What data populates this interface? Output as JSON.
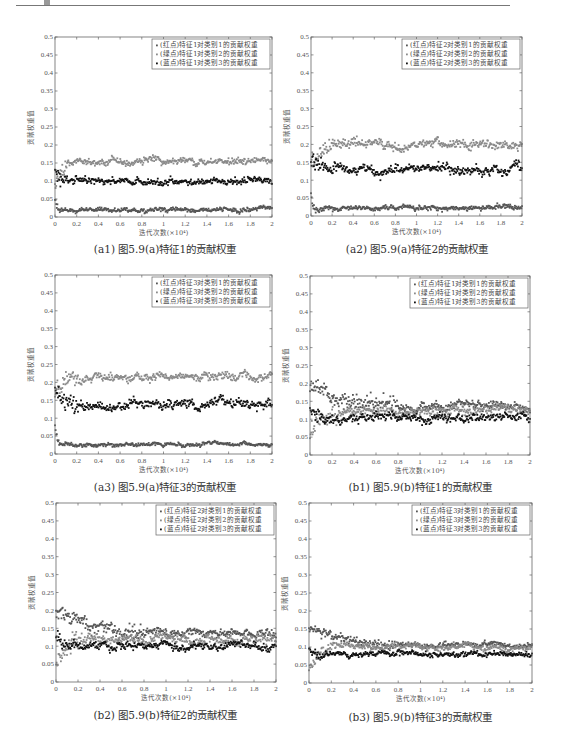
{
  "header": {
    "text": "……"
  },
  "colors": {
    "axis": "#666666",
    "series_red": "#555555",
    "series_green": "#8a8a8a",
    "series_blue": "#111111"
  },
  "chart_data": [
    {
      "id": "a1",
      "type": "scatter",
      "title": "",
      "caption": "(a1) 图5.9(a)特征1的贡献权重",
      "xlabel": "迭代次数(×10⁴)",
      "ylabel": "贡献权重值",
      "xlim": [
        0,
        2
      ],
      "ylim": [
        0,
        0.5
      ],
      "xticks": [
        "0",
        "0.2",
        "0.4",
        "0.6",
        "0.8",
        "1",
        "1.2",
        "1.4",
        "1.6",
        "1.8",
        "2"
      ],
      "yticks": [
        "0",
        "0.05",
        "0.1",
        "0.15",
        "0.2",
        "0.25",
        "0.3",
        "0.35",
        "0.4",
        "0.45",
        "0.5"
      ],
      "grid": false,
      "legend_position": "upper right",
      "series": [
        {
          "name": "(红点)特征1对类别1的贡献权重",
          "color_key": "series_red",
          "start": 0.05,
          "settle_x": 0.05,
          "mean": 0.02,
          "noise": 0.006
        },
        {
          "name": "(绿点)特征1对类别2的贡献权重",
          "color_key": "series_green",
          "start": 0.09,
          "settle_x": 0.15,
          "mean": 0.155,
          "noise": 0.01
        },
        {
          "name": "(蓝点)特征1对类别3的贡献权重",
          "color_key": "series_blue",
          "start": 0.13,
          "settle_x": 0.12,
          "mean": 0.1,
          "noise": 0.01
        }
      ]
    },
    {
      "id": "a2",
      "type": "scatter",
      "caption": "(a2) 图5.9(a)特征2的贡献权重",
      "xlabel": "迭代次数(×10⁴)",
      "ylabel": "贡献权重值",
      "xlim": [
        0,
        2
      ],
      "ylim": [
        0,
        0.5
      ],
      "xticks": [
        "0",
        "0.2",
        "0.4",
        "0.6",
        "0.8",
        "1",
        "1.2",
        "1.4",
        "1.6",
        "1.8",
        "2"
      ],
      "yticks": [
        "0",
        "0.05",
        "0.1",
        "0.15",
        "0.2",
        "0.25",
        "0.3",
        "0.35",
        "0.4",
        "0.45",
        "0.5"
      ],
      "grid": false,
      "legend_position": "upper right",
      "series": [
        {
          "name": "(红点)特征2对类别1的贡献权重",
          "color_key": "series_red",
          "start": 0.06,
          "settle_x": 0.05,
          "mean": 0.022,
          "noise": 0.007
        },
        {
          "name": "(绿点)特征2对类别2的贡献权重",
          "color_key": "series_green",
          "start": 0.15,
          "settle_x": 0.2,
          "mean": 0.2,
          "noise": 0.013
        },
        {
          "name": "(蓝点)特征2对类别3的贡献权重",
          "color_key": "series_blue",
          "start": 0.16,
          "settle_x": 0.15,
          "mean": 0.13,
          "noise": 0.013
        }
      ]
    },
    {
      "id": "a3",
      "type": "scatter",
      "caption": "(a3) 图5.9(a)特征3的贡献权重",
      "xlabel": "迭代次数(×10⁴)",
      "ylabel": "贡献权重值",
      "xlim": [
        0,
        2
      ],
      "ylim": [
        0,
        0.5
      ],
      "xticks": [
        "0",
        "0.2",
        "0.4",
        "0.6",
        "0.8",
        "1",
        "1.2",
        "1.4",
        "1.6",
        "1.8",
        "2"
      ],
      "yticks": [
        "0",
        "0.05",
        "0.1",
        "0.15",
        "0.2",
        "0.25",
        "0.3",
        "0.35",
        "0.4",
        "0.45",
        "0.5"
      ],
      "grid": false,
      "legend_position": "upper right",
      "series": [
        {
          "name": "(红点)特征3对类别1的贡献权重",
          "color_key": "series_red",
          "start": 0.08,
          "settle_x": 0.05,
          "mean": 0.027,
          "noise": 0.005
        },
        {
          "name": "(绿点)特征3对类别2的贡献权重",
          "color_key": "series_green",
          "start": 0.17,
          "settle_x": 0.2,
          "mean": 0.215,
          "noise": 0.013
        },
        {
          "name": "(蓝点)特征3对类别3的贡献权重",
          "color_key": "series_blue",
          "start": 0.18,
          "settle_x": 0.2,
          "mean": 0.14,
          "noise": 0.013
        }
      ]
    },
    {
      "id": "b1",
      "type": "scatter",
      "caption": "(b1) 图5.9(b)特征1的贡献权重",
      "xlabel": "迭代次数(×10⁴)",
      "ylabel": "贡献权重值",
      "xlim": [
        0,
        2
      ],
      "ylim": [
        0,
        0.5
      ],
      "xticks": [
        "0",
        "0.2",
        "0.4",
        "0.6",
        "0.8",
        "1",
        "1.2",
        "1.4",
        "1.6",
        "1.8",
        "2"
      ],
      "yticks": [
        "0",
        "0.05",
        "0.1",
        "0.15",
        "0.2",
        "0.25",
        "0.3",
        "0.35",
        "0.4",
        "0.45",
        "0.5"
      ],
      "grid": false,
      "legend_position": "upper right",
      "series": [
        {
          "name": "(红点)特征1对类别1的贡献权重",
          "color_key": "series_red",
          "start": 0.19,
          "settle_x": 0.8,
          "mean": 0.135,
          "noise": 0.012
        },
        {
          "name": "(绿点)特征1对类别2的贡献权重",
          "color_key": "series_green",
          "start": 0.06,
          "settle_x": 0.25,
          "mean": 0.12,
          "noise": 0.013
        },
        {
          "name": "(蓝点)特征1对类别3的贡献权重",
          "color_key": "series_blue",
          "start": 0.12,
          "settle_x": 0.15,
          "mean": 0.105,
          "noise": 0.012
        }
      ]
    },
    {
      "id": "b2",
      "type": "scatter",
      "caption": "(b2) 图5.9(b)特征2的贡献权重",
      "xlabel": "迭代次数(×10⁴)",
      "ylabel": "贡献权重值",
      "xlim": [
        0,
        2
      ],
      "ylim": [
        0,
        0.5
      ],
      "xticks": [
        "0",
        "0.2",
        "0.4",
        "0.6",
        "0.8",
        "1",
        "1.2",
        "1.4",
        "1.6",
        "1.8",
        "2"
      ],
      "yticks": [
        "0",
        "0.05",
        "0.1",
        "0.15",
        "0.2",
        "0.25",
        "0.3",
        "0.35",
        "0.4",
        "0.45",
        "0.5"
      ],
      "grid": false,
      "legend_position": "upper right",
      "series": [
        {
          "name": "(红点)特征2对类别1的贡献权重",
          "color_key": "series_red",
          "start": 0.2,
          "settle_x": 0.8,
          "mean": 0.135,
          "noise": 0.012
        },
        {
          "name": "(绿点)特征2对类别2的贡献权重",
          "color_key": "series_green",
          "start": 0.06,
          "settle_x": 0.3,
          "mean": 0.12,
          "noise": 0.013
        },
        {
          "name": "(蓝点)特征2对类别3的贡献权重",
          "color_key": "series_blue",
          "start": 0.13,
          "settle_x": 0.1,
          "mean": 0.1,
          "noise": 0.011
        }
      ]
    },
    {
      "id": "b3",
      "type": "scatter",
      "caption": "(b3) 图5.9(b)特征3的贡献权重",
      "xlabel": "迭代次数(×10⁴)",
      "ylabel": "贡献权重值",
      "xlim": [
        0,
        2
      ],
      "ylim": [
        0,
        0.5
      ],
      "xticks": [
        "0",
        "0.2",
        "0.4",
        "0.6",
        "0.8",
        "1",
        "1.2",
        "1.4",
        "1.6",
        "1.8",
        "2"
      ],
      "yticks": [
        "0",
        "0.05",
        "0.1",
        "0.15",
        "0.2",
        "0.25",
        "0.3",
        "0.35",
        "0.4",
        "0.45",
        "0.5"
      ],
      "grid": false,
      "legend_position": "upper right",
      "series": [
        {
          "name": "(红点)特征3对类别1的贡献权重",
          "color_key": "series_red",
          "start": 0.15,
          "settle_x": 0.8,
          "mean": 0.105,
          "noise": 0.008
        },
        {
          "name": "(绿点)特征3对类别2的贡献权重",
          "color_key": "series_green",
          "start": 0.04,
          "settle_x": 0.25,
          "mean": 0.1,
          "noise": 0.009
        },
        {
          "name": "(蓝点)特征3对类别3的贡献权重",
          "color_key": "series_blue",
          "start": 0.1,
          "settle_x": 0.1,
          "mean": 0.08,
          "noise": 0.008
        }
      ]
    }
  ]
}
